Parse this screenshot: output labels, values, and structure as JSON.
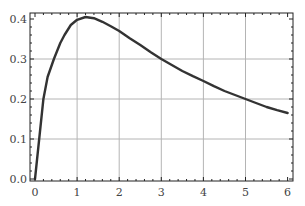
{
  "chart_data": {
    "type": "line",
    "title": "",
    "xlabel": "",
    "ylabel": "",
    "xlim": [
      0,
      6
    ],
    "ylim": [
      0,
      0.41
    ],
    "grid": true,
    "legend": null,
    "x_ticks": [
      "0",
      "1",
      "2",
      "3",
      "4",
      "5",
      "6"
    ],
    "y_ticks": [
      "0.0",
      "0.1",
      "0.2",
      "0.3",
      "0.4"
    ],
    "series": [
      {
        "name": "curve",
        "color": "#333333",
        "x": [
          0,
          0.05,
          0.1,
          0.2,
          0.3,
          0.45,
          0.6,
          0.7,
          0.85,
          1.0,
          1.2,
          1.4,
          1.6,
          1.8,
          2.0,
          2.25,
          2.5,
          2.75,
          3.0,
          3.25,
          3.5,
          3.75,
          4.0,
          4.25,
          4.5,
          4.75,
          5.0,
          5.25,
          5.5,
          5.75,
          6.0
        ],
        "values": [
          0,
          0.05,
          0.1,
          0.2,
          0.255,
          0.3,
          0.34,
          0.36,
          0.385,
          0.398,
          0.405,
          0.402,
          0.393,
          0.382,
          0.37,
          0.352,
          0.335,
          0.317,
          0.3,
          0.285,
          0.27,
          0.257,
          0.245,
          0.232,
          0.22,
          0.21,
          0.2,
          0.19,
          0.18,
          0.172,
          0.165
        ]
      }
    ]
  },
  "colors": {
    "frame": "#222222",
    "grid": "#b4b4b4",
    "curve": "#333333"
  }
}
